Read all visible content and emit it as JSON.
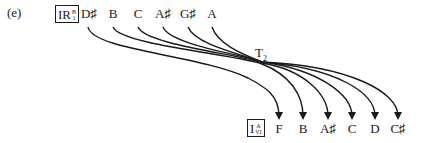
{
  "panel_label": "(e)",
  "top_row": {
    "box": {
      "main": "IR",
      "sup": "B",
      "sub": "1"
    },
    "notes": [
      "D♯",
      "B",
      "C",
      "A♯",
      "G♯",
      "A"
    ]
  },
  "bottom_row": {
    "box": {
      "main": "I",
      "sup": "A",
      "sub": "VI"
    },
    "notes": [
      "F",
      "B",
      "A♯",
      "C",
      "D",
      "C♯"
    ]
  },
  "transform": {
    "name": "T",
    "subscript": "2"
  },
  "mapping": [
    {
      "from": "D♯",
      "to": "F"
    },
    {
      "from": "B",
      "to": "B"
    },
    {
      "from": "C",
      "to": "A♯"
    },
    {
      "from": "A♯",
      "to": "C"
    },
    {
      "from": "G♯",
      "to": "D"
    },
    {
      "from": "A",
      "to": "C♯"
    }
  ],
  "colors": {
    "ink": "#1a1a1a",
    "background": "#ffffff"
  }
}
